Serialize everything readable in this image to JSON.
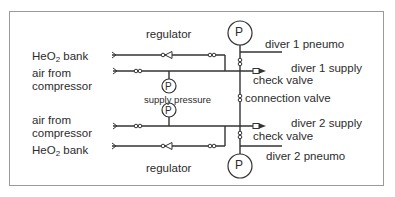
{
  "diagram": {
    "type": "gas-supply-schematic",
    "labels": {
      "regulator_top": "regulator",
      "regulator_bottom": "regulator",
      "heo2_top_prefix": "HeO",
      "heo2_top_sub": "2",
      "heo2_top_suffix": " bank",
      "heo2_bottom_prefix": "HeO",
      "heo2_bottom_sub": "2",
      "heo2_bottom_suffix": " bank",
      "air_top_line1": "air from",
      "air_top_line2": "compressor",
      "air_bottom_line1": "air from",
      "air_bottom_line2": "compressor",
      "supply_pressure": "supply pressure",
      "diver1_pneumo": "diver 1 pneumo",
      "diver1_supply": "diver 1 supply",
      "check_valve_top": "check valve",
      "connection_valve": "connection valve",
      "diver2_supply": "diver 2 supply",
      "check_valve_bottom": "check valve",
      "diver2_pneumo": "diver 2 pneumo"
    },
    "gauges": {
      "top": "P",
      "bottom": "P",
      "supply_upper": "P",
      "supply_lower": "P"
    },
    "colors": {
      "line": "#333333",
      "frame": "#9a9a9a",
      "text": "#2c2c2c",
      "background": "#ffffff"
    }
  }
}
